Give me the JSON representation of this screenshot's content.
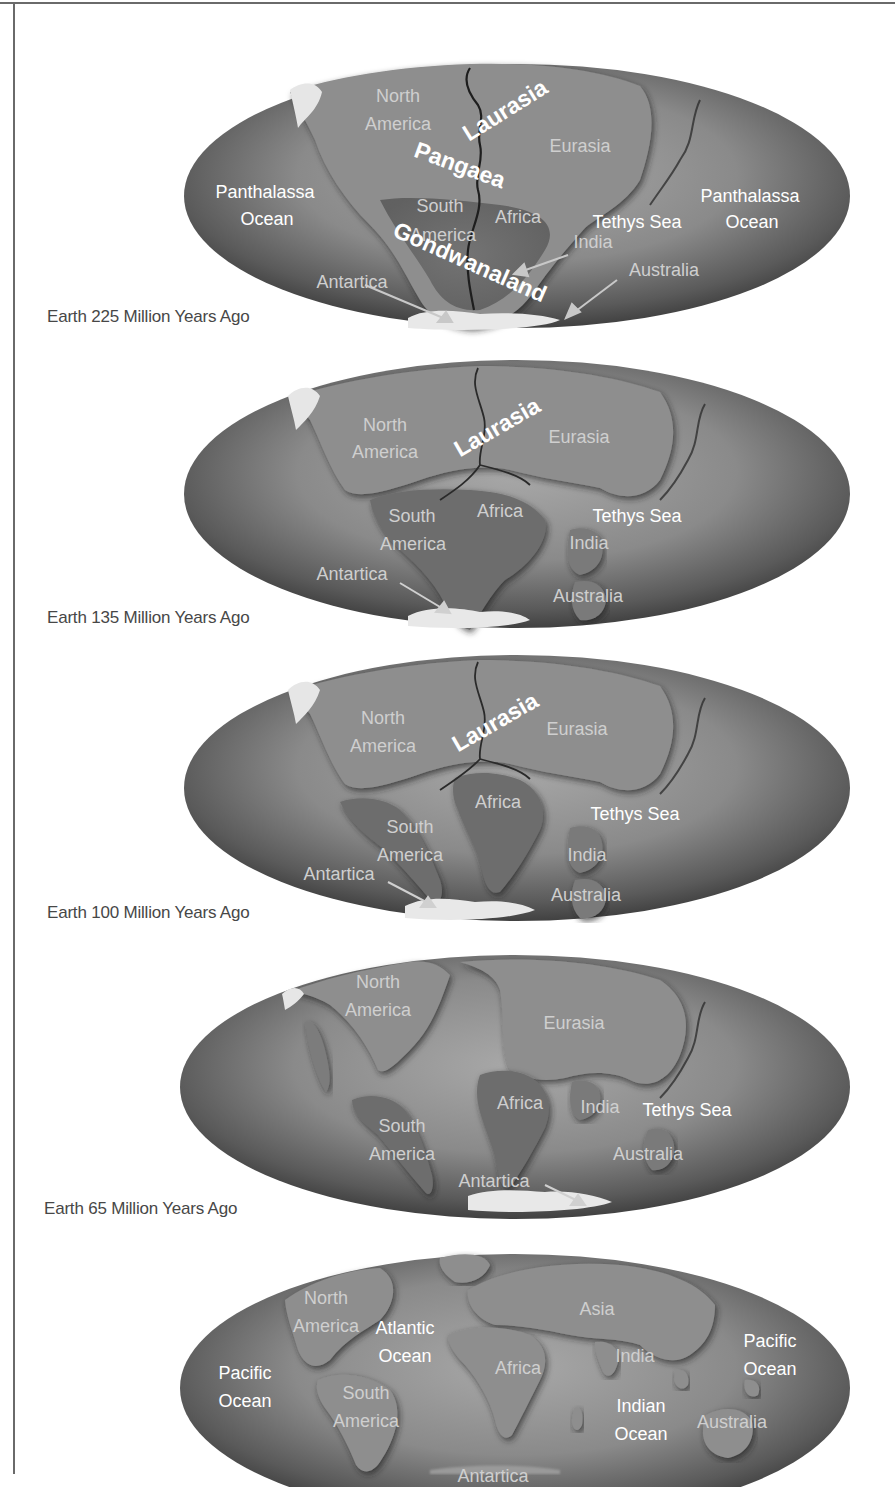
{
  "figure": {
    "colors": {
      "ocean_dark": "#3e3e3e",
      "ocean_light": "#9a9a9a",
      "land": "#8c8c8c",
      "ice": "#e8e8e8",
      "caption_text": "#474747",
      "frame": "#6a6a6a"
    },
    "panels": [
      {
        "caption": "Earth 225 Million Years Ago",
        "labels": {
          "north": "North",
          "america": "America",
          "laurasia": "Laurasia",
          "eurasia": "Eurasia",
          "pangaea": "Pangaea",
          "panthalassa_left_1": "Panthalassa",
          "panthalassa_left_2": "Ocean",
          "panthalassa_right_1": "Panthalassa",
          "panthalassa_right_2": "Ocean",
          "south": "South",
          "south_america": "America",
          "africa": "Africa",
          "tethys": "Tethys Sea",
          "india": "India",
          "gondwanaland": "Gondwanaland",
          "antartica": "Antartica",
          "australia": "Australia"
        }
      },
      {
        "caption": "Earth 135 Million Years Ago",
        "labels": {
          "north": "North",
          "america": "America",
          "laurasia": "Laurasia",
          "eurasia": "Eurasia",
          "south": "South",
          "south_america": "America",
          "africa": "Africa",
          "tethys": "Tethys Sea",
          "india": "India",
          "antartica": "Antartica",
          "australia": "Australia"
        }
      },
      {
        "caption": "Earth 100 Million Years Ago",
        "labels": {
          "north": "North",
          "america": "America",
          "laurasia": "Laurasia",
          "eurasia": "Eurasia",
          "africa": "Africa",
          "tethys": "Tethys Sea",
          "south": "South",
          "south_america": "America",
          "india": "India",
          "antartica": "Antartica",
          "australia": "Australia"
        }
      },
      {
        "caption": "Earth 65 Million Years Ago",
        "labels": {
          "north": "North",
          "america": "America",
          "eurasia": "Eurasia",
          "africa": "Africa",
          "india": "India",
          "tethys": "Tethys Sea",
          "south": "South",
          "south_america": "America",
          "australia": "Australia",
          "antartica": "Antartica"
        }
      },
      {
        "caption": "",
        "labels": {
          "north": "North",
          "america": "America",
          "atlantic_1": "Atlantic",
          "atlantic_2": "Ocean",
          "asia": "Asia",
          "pacific_right_1": "Pacific",
          "pacific_right_2": "Ocean",
          "india": "India",
          "pacific_left_1": "Pacific",
          "pacific_left_2": "Ocean",
          "africa": "Africa",
          "south": "South",
          "south_america": "America",
          "indian_1": "Indian",
          "indian_2": "Ocean",
          "australia": "Australia",
          "antartica": "Antartica"
        }
      }
    ]
  }
}
